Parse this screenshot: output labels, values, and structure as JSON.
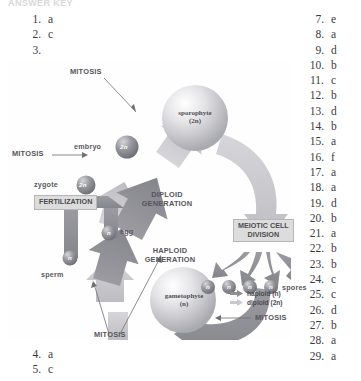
{
  "page": {
    "running_header": "ANSWER KEY"
  },
  "answers_left_top": [
    {
      "num": "1.",
      "val": "a"
    },
    {
      "num": "2.",
      "val": "c"
    },
    {
      "num": "3.",
      "val": ""
    }
  ],
  "answers_left_bottom": [
    {
      "num": "4.",
      "val": "a"
    },
    {
      "num": "5.",
      "val": "c"
    }
  ],
  "answers_right": [
    {
      "num": "7.",
      "val": "e"
    },
    {
      "num": "8.",
      "val": "a"
    },
    {
      "num": "9.",
      "val": "d"
    },
    {
      "num": "10.",
      "val": "b"
    },
    {
      "num": "11.",
      "val": "c"
    },
    {
      "num": "12.",
      "val": "b"
    },
    {
      "num": "13.",
      "val": "d"
    },
    {
      "num": "14.",
      "val": "b"
    },
    {
      "num": "15.",
      "val": "a"
    },
    {
      "num": "16.",
      "val": "f"
    },
    {
      "num": "17.",
      "val": "a"
    },
    {
      "num": "18.",
      "val": "a"
    },
    {
      "num": "19.",
      "val": "d"
    },
    {
      "num": "20.",
      "val": "b"
    },
    {
      "num": "21.",
      "val": "a"
    },
    {
      "num": "22.",
      "val": "b"
    },
    {
      "num": "23.",
      "val": "b"
    },
    {
      "num": "24.",
      "val": "c"
    },
    {
      "num": "25.",
      "val": "c"
    },
    {
      "num": "26.",
      "val": "d"
    },
    {
      "num": "27.",
      "val": "b"
    },
    {
      "num": "28.",
      "val": "a"
    },
    {
      "num": "29.",
      "val": "a"
    }
  ],
  "figure": {
    "labels": {
      "mitosis_top": "MITOSIS",
      "mitosis_left": "MITOSIS",
      "mitosis_bottom": "MITOSIS",
      "mitosis_right": "MITOSIS",
      "embryo": "embryo",
      "zygote": "zygote",
      "sperm": "sperm",
      "egg": "egg",
      "spores": "spores",
      "diploid_generation_l1": "DIPLOID",
      "diploid_generation_l2": "GENERATION",
      "haploid_generation_l1": "HAPLOID",
      "haploid_generation_l2": "GENERATION",
      "fertilization": "FERTILIZATION",
      "meiotic_cell_division_l1": "MEIOTIC CELL",
      "meiotic_cell_division_l2": "DIVISION",
      "sporophyte_name": "sporophyte",
      "sporophyte_ploidy": "(2n)",
      "gametophyte_name": "gametophyte",
      "gametophyte_ploidy": "(n)",
      "cell_2n": "2n",
      "cell_n": "n"
    },
    "legend": {
      "haploid": "haploid (n)",
      "diploid": "diploid (2n)"
    },
    "colors": {
      "haploid_arrow": "#8e8e93",
      "diploid_arrow": "#c9c9cd",
      "box_fill": "#dcdcdc",
      "text": "#4b4b50"
    }
  }
}
